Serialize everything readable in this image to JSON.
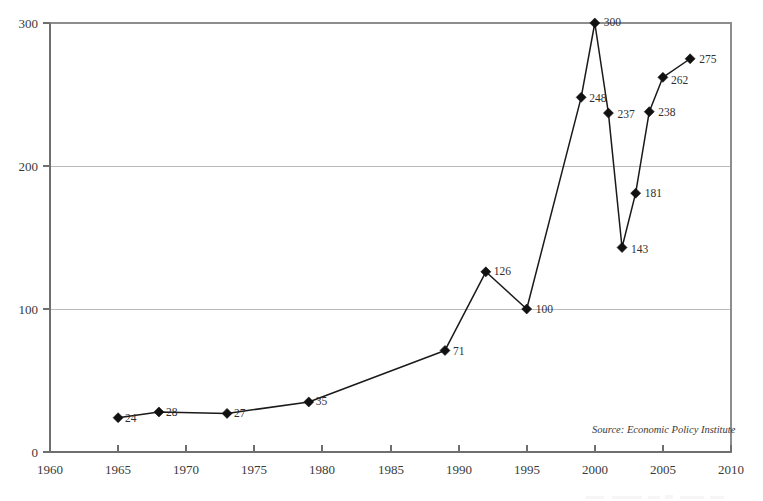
{
  "chart_data": {
    "type": "line",
    "title": "",
    "subtitle": "",
    "xlabel": "",
    "ylabel": "",
    "xlim": [
      1960,
      2010
    ],
    "ylim": [
      0,
      300
    ],
    "grid": true,
    "legend": "none",
    "x": [
      1965,
      1968,
      1973,
      1979,
      1989,
      1992,
      1995,
      1999,
      2000,
      2001,
      2002,
      2003,
      2004,
      2005,
      2007
    ],
    "values": [
      24,
      28,
      27,
      35,
      71,
      126,
      100,
      248,
      300,
      237,
      143,
      181,
      238,
      262,
      275
    ],
    "point_labels": [
      "24",
      "28",
      "27",
      "35",
      "71",
      "126",
      "100",
      "248",
      "300",
      "237",
      "143",
      "181",
      "238",
      "262",
      "275"
    ],
    "xticks": [
      1960,
      1965,
      1970,
      1975,
      1980,
      1985,
      1990,
      1995,
      2000,
      2005,
      2010
    ],
    "xtick_labels": [
      "1960",
      "1965",
      "1970",
      "1975",
      "1980",
      "1985",
      "1990",
      "1995",
      "2000",
      "2005",
      "2010"
    ],
    "yticks": [
      0,
      100,
      200,
      300
    ],
    "ytick_labels": [
      "0",
      "100",
      "200",
      "300"
    ],
    "annotations": [
      {
        "name": "source-note",
        "text": "Source: Economic Policy Institute"
      }
    ],
    "colors": {
      "line": "#1a1a1a",
      "marker": "#111111",
      "grid": "#b9b9b9",
      "frame": "#8d8d8d",
      "background": "#ffffff"
    }
  },
  "axes": {
    "y": {
      "tick_0": "0",
      "tick_100": "100",
      "tick_200": "200",
      "tick_300": "300"
    },
    "x": {
      "tick_1960": "1960",
      "tick_1965": "1965",
      "tick_1970": "1970",
      "tick_1975": "1975",
      "tick_1980": "1980",
      "tick_1985": "1985",
      "tick_1990": "1990",
      "tick_1995": "1995",
      "tick_2000": "2000",
      "tick_2005": "2005",
      "tick_2010": "2010"
    }
  },
  "labels": {
    "p0": "24",
    "p1": "28",
    "p2": "27",
    "p3": "35",
    "p4": "71",
    "p5": "126",
    "p6": "100",
    "p7": "248",
    "p8": "300",
    "p9": "237",
    "p10": "143",
    "p11": "181",
    "p12": "238",
    "p13": "262",
    "p14": "275"
  },
  "notes": {
    "source": "Source: Economic Policy Institute"
  }
}
